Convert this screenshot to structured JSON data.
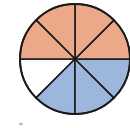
{
  "figure": {
    "label_fragment": ")"
  },
  "pie": {
    "total_parts": 8,
    "center": [
      75,
      59
    ],
    "radius": 55,
    "stroke_color": "#1a1a1a",
    "slices": [
      {
        "index": 0,
        "start_deg": 180,
        "end_deg": 225,
        "fill": "#ffffff",
        "group": "unshaded"
      },
      {
        "index": 1,
        "start_deg": 225,
        "end_deg": 270,
        "fill": "#9db6dc",
        "group": "blue"
      },
      {
        "index": 2,
        "start_deg": 270,
        "end_deg": 315,
        "fill": "#9db6dc",
        "group": "blue"
      },
      {
        "index": 3,
        "start_deg": 315,
        "end_deg": 360,
        "fill": "#9db6dc",
        "group": "blue"
      },
      {
        "index": 4,
        "start_deg": 0,
        "end_deg": 45,
        "fill": "#eba98a",
        "group": "orange"
      },
      {
        "index": 5,
        "start_deg": 45,
        "end_deg": 90,
        "fill": "#eba98a",
        "group": "orange"
      },
      {
        "index": 6,
        "start_deg": 90,
        "end_deg": 135,
        "fill": "#eba98a",
        "group": "orange"
      },
      {
        "index": 7,
        "start_deg": 135,
        "end_deg": 180,
        "fill": "#eba98a",
        "group": "orange"
      }
    ],
    "counts": {
      "orange": 4,
      "blue": 3,
      "unshaded": 1
    }
  },
  "colors": {
    "orange": "#eba98a",
    "blue": "#9db6dc",
    "unshaded": "#ffffff",
    "outline": "#1a1a1a"
  }
}
